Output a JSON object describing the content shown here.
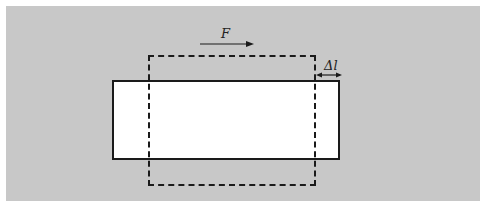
{
  "diagram": {
    "force_label": "F",
    "force_direction": "right",
    "elongation_label": "Δl",
    "shapes": {
      "solid_rectangle": {
        "x": 112,
        "y": 80,
        "width": 228,
        "height": 80,
        "style": "solid"
      },
      "dashed_rectangle": {
        "x": 148,
        "y": 55,
        "width": 168,
        "height": 131,
        "style": "dashed"
      }
    },
    "colors": {
      "background": "#c8c8c8",
      "fill": "#ffffff",
      "stroke": "#1a1a1a"
    }
  }
}
